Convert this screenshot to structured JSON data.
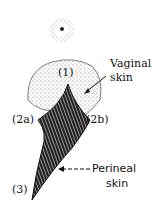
{
  "diagram": {
    "labels": {
      "point1": "(1)",
      "point2a": "(2a)",
      "point2b": "(2b)",
      "point3": "(3)",
      "vaginal_line1": "Vaginal",
      "vaginal_line2": "skin",
      "perineal_line1": "Perineal",
      "perineal_line2": "skin"
    },
    "colors": {
      "ink": "#111111",
      "stipple": "#555555"
    }
  }
}
